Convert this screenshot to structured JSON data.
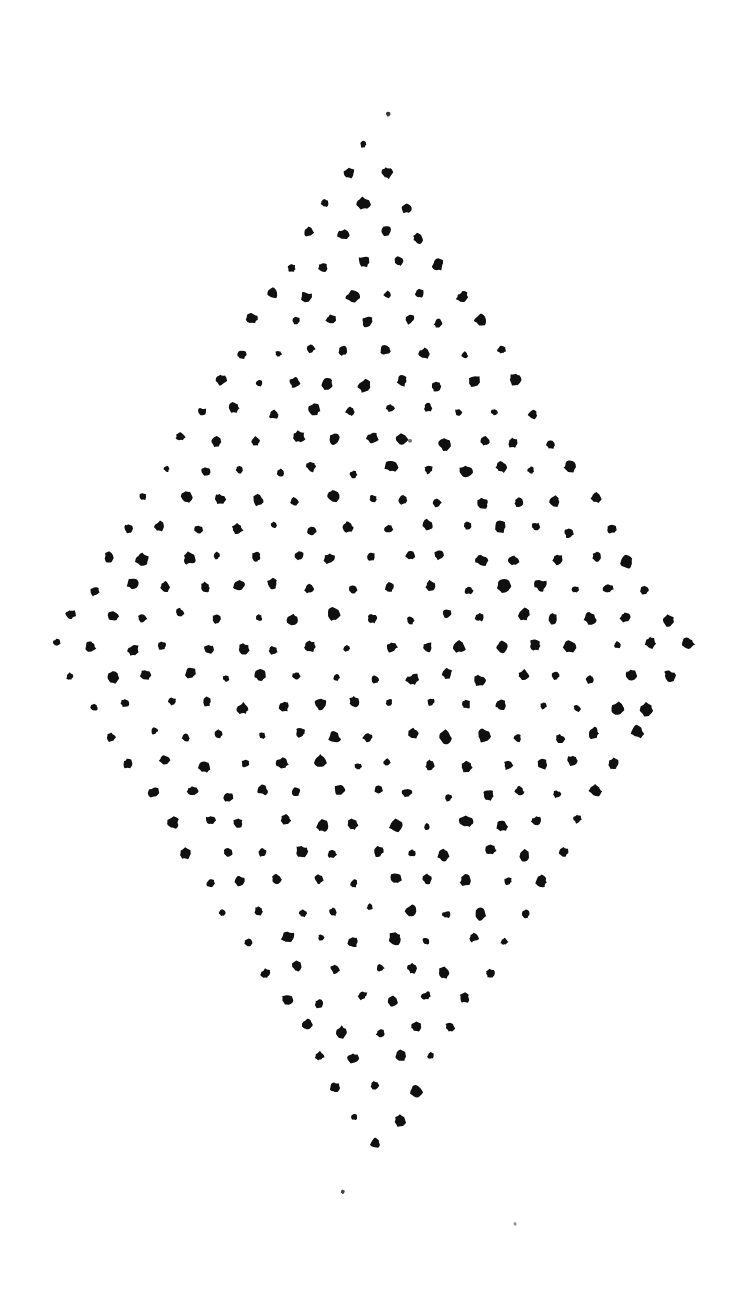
{
  "figure": {
    "background_color": "#ffffff",
    "dot_color": "#101010",
    "canvas": {
      "width": 745,
      "height": 1296
    }
  },
  "chart_data": {
    "type": "scatter",
    "subtitle": "",
    "xlabel": "",
    "ylabel": "",
    "xlim": [
      0,
      745
    ],
    "ylim": [
      0,
      1296
    ],
    "grid": false,
    "legend": null,
    "annotations": [],
    "marker": {
      "shape": "circle",
      "color": "#101010",
      "mean_radius_px": 4.8,
      "radius_jitter_px": 1.6,
      "edge_irregularity": 0.35
    },
    "lattice": {
      "shape": "rhombus",
      "rows": 39,
      "row_spacing_px": 29.4,
      "column_spacing_px": 37.2,
      "row_offset_alternating": true,
      "position_jitter_px": 5.5,
      "apex_top": [
        363,
        88
      ],
      "apex_bottom": [
        378,
        1230
      ],
      "apex_left": [
        53,
        655
      ],
      "apex_right": [
        690,
        655
      ],
      "center": [
        371,
        655
      ],
      "max_row_index": 19,
      "max_row_dot_count": 18,
      "total_dots_approx": 700
    },
    "stray_specks": [
      {
        "x": 515,
        "y": 1224,
        "radius_px": 1.6,
        "opacity": 0.45
      },
      {
        "x": 388,
        "y": 114,
        "radius_px": 2.2,
        "opacity": 0.85
      },
      {
        "x": 410,
        "y": 441,
        "radius_px": 2.0,
        "opacity": 0.6
      },
      {
        "x": 343,
        "y": 1192,
        "radius_px": 2.1,
        "opacity": 0.8
      }
    ],
    "series": [
      {
        "name": "lattice dots",
        "color": "#101010",
        "note": "Point coordinates are generated from the lattice parameters plus a deterministic pseudo-random jitter; see lattice block for the generating rule."
      }
    ]
  }
}
